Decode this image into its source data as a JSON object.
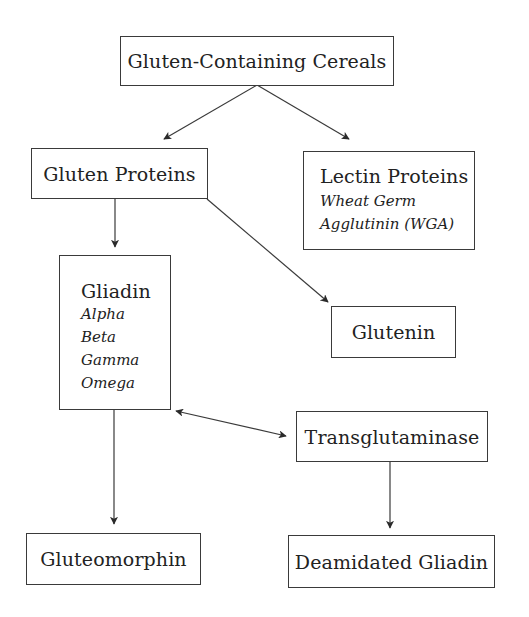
{
  "diagram": {
    "type": "flowchart",
    "colors": {
      "line": "#3a3a3a",
      "text": "#222222",
      "background": "#ffffff"
    },
    "nodes": {
      "cereals": {
        "title": "Gluten-Containing Cereals"
      },
      "gluten_proteins": {
        "title": "Gluten Proteins"
      },
      "lectin_proteins": {
        "title": "Lectin Proteins",
        "sub": [
          "Wheat Germ",
          "Agglutinin (WGA)"
        ]
      },
      "gliadin": {
        "title": "Gliadin",
        "sub": [
          "Alpha",
          "Beta",
          "Gamma",
          "Omega"
        ]
      },
      "glutenin": {
        "title": "Glutenin"
      },
      "transglutaminase": {
        "title": "Transglutaminase"
      },
      "gluteomorphin": {
        "title": "Gluteomorphin"
      },
      "deamidated_gliadin": {
        "title": "Deamidated Gliadin"
      }
    },
    "edges": [
      {
        "from": "Gluten-Containing Cereals",
        "to": "Gluten Proteins",
        "direction": "forward"
      },
      {
        "from": "Gluten-Containing Cereals",
        "to": "Lectin Proteins",
        "direction": "forward"
      },
      {
        "from": "Gluten Proteins",
        "to": "Gliadin",
        "direction": "forward"
      },
      {
        "from": "Gluten Proteins",
        "to": "Glutenin",
        "direction": "forward"
      },
      {
        "from": "Gliadin",
        "to": "Gluteomorphin",
        "direction": "forward"
      },
      {
        "from": "Gliadin",
        "to": "Transglutaminase",
        "direction": "both"
      },
      {
        "from": "Transglutaminase",
        "to": "Deamidated Gliadin",
        "direction": "forward"
      }
    ]
  }
}
